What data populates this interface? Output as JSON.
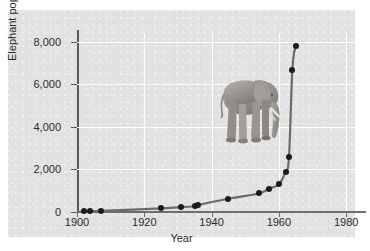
{
  "chart_data": {
    "type": "line",
    "title": "",
    "xlabel": "Year",
    "ylabel": "Elephant population",
    "xlim": [
      1900,
      1985
    ],
    "ylim": [
      0,
      8400
    ],
    "xticks": [
      "1900",
      "1920",
      "1940",
      "1960",
      "1980"
    ],
    "xtick_values": [
      1900,
      1920,
      1940,
      1960,
      1980
    ],
    "yticks": [
      "0",
      "2,000",
      "4,000",
      "6,000",
      "8,000"
    ],
    "ytick_values": [
      0,
      2000,
      4000,
      6000,
      8000
    ],
    "grid": true,
    "legend": "none",
    "series": [
      {
        "name": "Elephant population",
        "x": [
          1902,
          1904,
          1907,
          1925,
          1931,
          1935,
          1936,
          1945,
          1954,
          1957,
          1960,
          1962,
          1963,
          1964,
          1965
        ],
        "values": [
          40,
          45,
          50,
          170,
          230,
          270,
          330,
          620,
          870,
          1100,
          1300,
          1900,
          2600,
          6650,
          7800
        ]
      }
    ],
    "annotations": [
      {
        "name": "elephant-illustration",
        "label": "elephant"
      }
    ],
    "colors": {
      "line": "#6b6b6b",
      "marker": "#1b1b1b",
      "plot_background": "#e2e2e2",
      "gridline": "#ffffff",
      "axis": "#5a5a5a",
      "text": "#2a2a2a",
      "figure_background": "#ffffff"
    }
  },
  "axis_titles": {
    "x": "Year",
    "y": "Elephant population"
  }
}
